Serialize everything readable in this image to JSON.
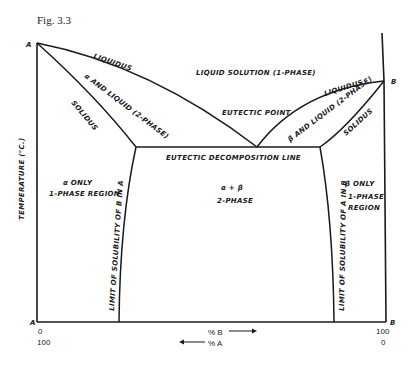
{
  "figure": {
    "title": "Fig. 3.3",
    "y_axis_label": "TEMPERATURE (°C.)",
    "points": {
      "A_top": "A",
      "B_top": "B",
      "A_bottom": "A",
      "B_bottom": "B"
    },
    "x_axis": {
      "left_top": "0",
      "left_bottom": "100",
      "right_top": "100",
      "right_bottom": "0",
      "pct_b": "% B",
      "pct_a": "% A"
    },
    "regions": {
      "liquid": "LIQUID SOLUTION (1-PHASE)",
      "alpha_liquid": "α AND LIQUID (2-PHASE)",
      "beta_liquid": "β AND LIQUID (2-PHASE)",
      "alpha_only_1": "α ONLY",
      "alpha_only_2": "1-PHASE REGION",
      "beta_only_1": "β ONLY",
      "beta_only_2": "1-PHASE",
      "beta_only_3": "REGION",
      "two_phase_1": "α + β",
      "two_phase_2": "2-PHASE"
    },
    "lines": {
      "liquidus_left": "LIQUIDUS",
      "solidus_left": "SOLIDUS",
      "liquidus_right": "LIQUIDUS",
      "solidus_right": "SOLIDUS",
      "eutectic_point": "EUTECTIC POINT",
      "eutectic_line": "EUTECTIC DECOMPOSITION LINE",
      "solvus_left": "LIMIT OF SOLUBILITY OF B IN A",
      "solvus_right": "LIMIT OF SOLUBILITY OF A IN B"
    },
    "colors": {
      "ink": "#1a1a1a",
      "background": "#ffffff"
    }
  }
}
